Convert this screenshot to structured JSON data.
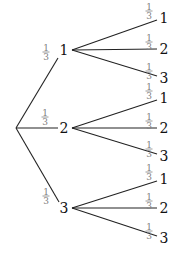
{
  "diagram": {
    "type": "probability-tree",
    "root": {
      "x": 16,
      "y": 128
    },
    "level1": [
      {
        "label": "1",
        "x": 64,
        "y": 50,
        "prob_num": "1",
        "prob_den": "3",
        "fx": 46,
        "fy": 52,
        "end": [
          58,
          58
        ],
        "children": [
          {
            "label": "1",
            "y": 18,
            "prob_num": "1",
            "prob_den": "3"
          },
          {
            "label": "2",
            "y": 49,
            "prob_num": "1",
            "prob_den": "3"
          },
          {
            "label": "3",
            "y": 78,
            "prob_num": "1",
            "prob_den": "3"
          }
        ]
      },
      {
        "label": "2",
        "x": 64,
        "y": 128,
        "prob_num": "1",
        "prob_den": "3",
        "fx": 45,
        "fy": 117,
        "end": [
          58,
          128
        ],
        "children": [
          {
            "label": "1",
            "y": 98,
            "prob_num": "1",
            "prob_den": "3"
          },
          {
            "label": "2",
            "y": 128,
            "prob_num": "1",
            "prob_den": "3"
          },
          {
            "label": "3",
            "y": 156,
            "prob_num": "1",
            "prob_den": "3"
          }
        ]
      },
      {
        "label": "3",
        "x": 64,
        "y": 208,
        "prob_num": "1",
        "prob_den": "3",
        "fx": 46,
        "fy": 196,
        "end": [
          59,
          202
        ],
        "children": [
          {
            "label": "1",
            "y": 179,
            "prob_num": "1",
            "prob_den": "3"
          },
          {
            "label": "2",
            "y": 208,
            "prob_num": "1",
            "prob_den": "3"
          },
          {
            "label": "3",
            "y": 238,
            "prob_num": "1",
            "prob_den": "3"
          }
        ]
      }
    ]
  },
  "colors": {
    "edge": "#222222",
    "fraction": "#808080",
    "label": "#111111"
  }
}
